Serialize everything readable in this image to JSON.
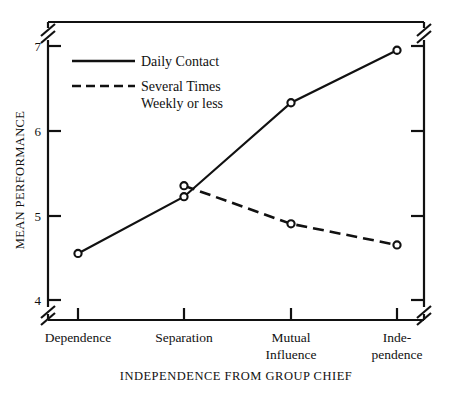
{
  "chart_data": {
    "type": "line",
    "title": "",
    "xlabel": "INDEPENDENCE FROM GROUP CHIEF",
    "ylabel": "MEAN PERFORMANCE",
    "categories": [
      "Dependence",
      "Separation",
      "Mutual Influence",
      "Inde-pendence"
    ],
    "category_lines": [
      [
        "Dependence"
      ],
      [
        "Separation"
      ],
      [
        "Mutual",
        "Influence"
      ],
      [
        "Inde-",
        "pendence"
      ]
    ],
    "yticks": [
      4,
      5,
      6,
      7
    ],
    "ytick_labels": [
      "4",
      "5",
      "6",
      "7"
    ],
    "ylim": [
      4,
      7
    ],
    "axis_break": true,
    "grid": false,
    "legend_position": "upper-left-inside",
    "marker": "open-circle",
    "series": [
      {
        "name": "Daily Contact",
        "style": "solid",
        "values": [
          4.55,
          5.22,
          6.33,
          6.95
        ]
      },
      {
        "name": "Several Times Weekly or less",
        "style": "dashed",
        "values": [
          null,
          5.35,
          4.9,
          4.65
        ]
      }
    ]
  },
  "legend": {
    "entries": [
      {
        "label": "Daily Contact",
        "style": "solid"
      },
      {
        "label_line1": "Several Times",
        "label_line2": "Weekly or less",
        "style": "dashed"
      }
    ]
  },
  "axes": {
    "y_title": "MEAN PERFORMANCE",
    "x_title": "INDEPENDENCE FROM GROUP CHIEF",
    "y_tick_7": "7",
    "y_tick_6": "6",
    "y_tick_5": "5",
    "y_tick_4": "4",
    "x_tick_1": "Dependence",
    "x_tick_2": "Separation",
    "x_tick_3_line1": "Mutual",
    "x_tick_3_line2": "Influence",
    "x_tick_4_line1": "Inde-",
    "x_tick_4_line2": "pendence"
  },
  "colors": {
    "ink": "#111111",
    "background": "#ffffff"
  }
}
